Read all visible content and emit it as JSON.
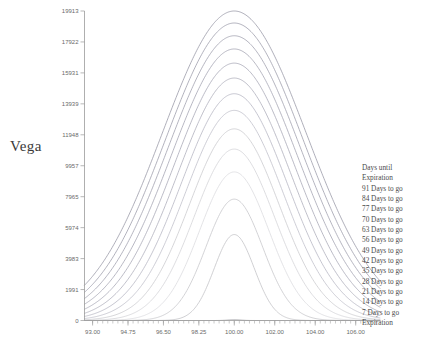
{
  "axis_label": "Vega",
  "title": "",
  "legend": {
    "header_line1": "Days until",
    "header_line2": "Expiration",
    "entries": [
      "91 Days to go",
      "84 Days to go",
      "77 Days to go",
      "70 Days to go",
      "63 Days to go",
      "56 Days to go",
      "49 Days to go",
      "42 Days to go",
      "35 Days to go",
      "28 Days to go",
      "21 Days to go",
      "14 Days to go",
      "7 Days to go",
      "Expiration"
    ]
  },
  "chart_data": {
    "type": "line",
    "title": "",
    "xlabel": "",
    "ylabel": "Vega",
    "xlim": [
      92.6,
      107.2
    ],
    "ylim": [
      0,
      19913
    ],
    "grid": false,
    "legend_position": "right",
    "x_ticks": [
      "93.00",
      "94.75",
      "96.50",
      "98.25",
      "100.00",
      "102.00",
      "104.00",
      "106.00"
    ],
    "x_tick_values": [
      93.0,
      94.75,
      96.5,
      98.25,
      100.0,
      102.0,
      104.0,
      106.0
    ],
    "y_ticks": [
      "0",
      "1991",
      "3983",
      "5974",
      "7965",
      "9957",
      "11948",
      "13939",
      "15931",
      "17922",
      "19913"
    ],
    "y_tick_values": [
      0,
      1991,
      3983,
      5974,
      7965,
      9957,
      11948,
      13939,
      15931,
      17922,
      19913
    ],
    "x": [
      92.6,
      93.0,
      93.5,
      94.0,
      94.5,
      95.0,
      95.5,
      96.0,
      96.5,
      97.0,
      97.5,
      98.0,
      98.5,
      99.0,
      99.5,
      100.0,
      100.5,
      101.0,
      101.5,
      102.0,
      102.5,
      103.0,
      103.5,
      104.0,
      104.5,
      105.0,
      105.5,
      106.0,
      106.5,
      107.2
    ],
    "series": [
      {
        "name": "91 Days to go",
        "days": 91,
        "peak": 19913,
        "sigma": 3.55,
        "color": "#9a9aa8"
      },
      {
        "name": "84 Days to go",
        "days": 84,
        "peak": 19140,
        "sigma": 3.41,
        "color": "#9e9eac"
      },
      {
        "name": "77 Days to go",
        "days": 77,
        "peak": 18320,
        "sigma": 3.27,
        "color": "#a2a2b0"
      },
      {
        "name": "70 Days to go",
        "days": 70,
        "peak": 17470,
        "sigma": 3.12,
        "color": "#a6a6b4"
      },
      {
        "name": "63 Days to go",
        "days": 63,
        "peak": 16560,
        "sigma": 2.96,
        "color": "#aaaab8"
      },
      {
        "name": "56 Days to go",
        "days": 56,
        "peak": 15600,
        "sigma": 2.79,
        "color": "#b0b0bd"
      },
      {
        "name": "49 Days to go",
        "days": 49,
        "peak": 14590,
        "sigma": 2.61,
        "color": "#b8b8c4"
      },
      {
        "name": "42 Days to go",
        "days": 42,
        "peak": 13520,
        "sigma": 2.42,
        "color": "#c2c2cc"
      },
      {
        "name": "35 Days to go",
        "days": 35,
        "peak": 12330,
        "sigma": 2.21,
        "color": "#cccccf"
      },
      {
        "name": "28 Days to go",
        "days": 28,
        "peak": 11030,
        "sigma": 1.98,
        "color": "#d4d4d8"
      },
      {
        "name": "21 Days to go",
        "days": 21,
        "peak": 9560,
        "sigma": 1.71,
        "color": "#dcdce0"
      },
      {
        "name": "14 Days to go",
        "days": 14,
        "peak": 7810,
        "sigma": 1.4,
        "color": "#c8c8cc"
      },
      {
        "name": "7 Days to go",
        "days": 7,
        "peak": 5530,
        "sigma": 0.99,
        "color": "#c4c4c8"
      },
      {
        "name": "Expiration",
        "days": 0,
        "peak": 60,
        "sigma": 0.32,
        "color": "#b4b4b8"
      }
    ]
  }
}
